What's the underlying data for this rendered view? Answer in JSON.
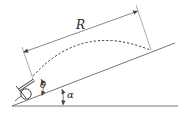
{
  "diagram": {
    "labels": {
      "range": "R",
      "launch_angle": "θ",
      "incline_angle": "α"
    },
    "elements": {
      "ground": "horizontal ground line",
      "incline": "inclined plane at angle α",
      "cannon": "cannon on wheel at base of incline",
      "trajectory": "dashed parabolic trajectory",
      "range_dimension": "dimension line R along incline"
    },
    "colors": {
      "line": "#555555",
      "text": "#222222"
    }
  }
}
